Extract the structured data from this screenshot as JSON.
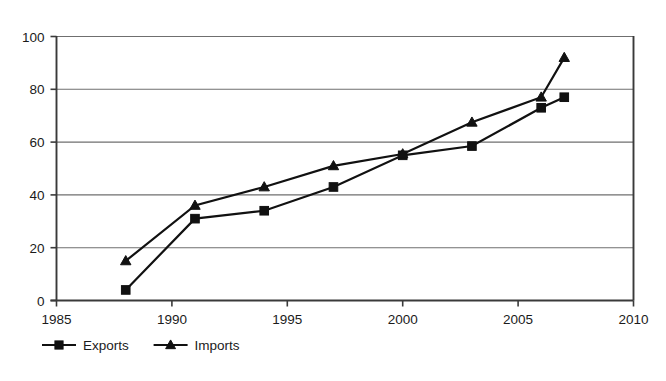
{
  "chart_data": {
    "type": "line",
    "title": "",
    "subtitle": "",
    "xlabel": "",
    "ylabel": "",
    "xlim": [
      1985,
      2010
    ],
    "ylim": [
      0,
      100
    ],
    "grid": true,
    "legend_position": "bottom-left",
    "x_ticks": [
      "1985",
      "1990",
      "1995",
      "2000",
      "2005",
      "2010"
    ],
    "x_tick_values": [
      1985,
      1990,
      1995,
      2000,
      2005,
      2010
    ],
    "y_ticks": [
      "0",
      "20",
      "40",
      "60",
      "80",
      "100"
    ],
    "y_tick_values": [
      0,
      20,
      40,
      60,
      80,
      100
    ],
    "x": [
      1988,
      1991,
      1994,
      1997,
      2000,
      2003,
      2006,
      2007
    ],
    "series": [
      {
        "name": "Exports",
        "marker": "square",
        "color": "#111111",
        "values": [
          4,
          31,
          34,
          43,
          55,
          58.5,
          73,
          77
        ]
      },
      {
        "name": "Imports",
        "marker": "triangle",
        "color": "#111111",
        "values": [
          15,
          36,
          43,
          51,
          55.5,
          67.5,
          77,
          92
        ]
      }
    ]
  },
  "legend": {
    "items": [
      {
        "label": "Exports",
        "marker": "square-marker-icon"
      },
      {
        "label": "Imports",
        "marker": "triangle-marker-icon"
      }
    ]
  },
  "colors": {
    "ink": "#111111",
    "grid": "#6f6f6f",
    "axis": "#3a3a3a",
    "background": "#ffffff"
  }
}
